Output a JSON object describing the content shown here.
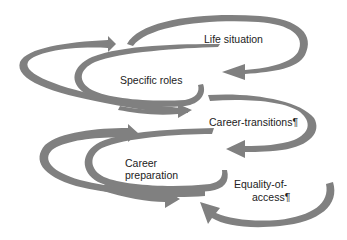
{
  "diagram": {
    "arrow_color": "#808080",
    "background": "#ffffff",
    "labels": {
      "life_situation": "Life situation",
      "specific_roles": "Specific roles",
      "career_transitions": "Career-transitions¶",
      "career_preparation_line1": "Career",
      "career_preparation_line2": "preparation",
      "equality_of_access_line1": "Equality-of-",
      "equality_of_access_line2": "access¶"
    }
  }
}
